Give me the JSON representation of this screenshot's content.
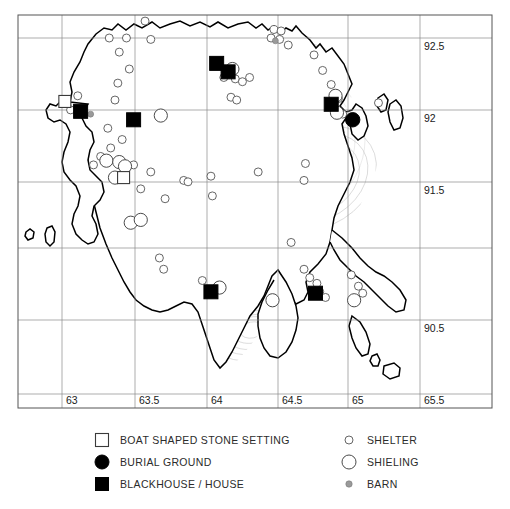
{
  "figure": {
    "kind": "archaeological-distribution-map",
    "background": "#ffffff"
  },
  "axes": {
    "x_ticks": [
      "63",
      "63.5",
      "64",
      "64.5",
      "65",
      "65.5"
    ],
    "y_ticks": [
      "92.5",
      "92",
      "91.5",
      "90.5"
    ],
    "grid": "on"
  },
  "legend": {
    "left_column": [
      {
        "label": "BOAT SHAPED STONE SETTING",
        "symbol": "open-square"
      },
      {
        "label": "BURIAL GROUND",
        "symbol": "filled-circle"
      },
      {
        "label": "BLACKHOUSE / HOUSE",
        "symbol": "filled-square"
      }
    ],
    "right_column": [
      {
        "label": "SHELTER",
        "symbol": "small-open-circle"
      },
      {
        "label": "SHIELING",
        "symbol": "large-open-circle"
      },
      {
        "label": "BARN",
        "symbol": "small-grey-dot"
      }
    ]
  },
  "chart_data": {
    "type": "scatter",
    "title": "",
    "xlabel": "",
    "ylabel": "",
    "xlim": [
      62.7,
      65.7
    ],
    "ylim": [
      90.2,
      92.8
    ],
    "grid": true,
    "legend_position": "below-plot",
    "series": [
      {
        "name": "BOAT SHAPED STONE SETTING",
        "symbol": "open-square",
        "color": "#ffffff",
        "points": [
          [
            63.02,
            92.05
          ],
          [
            63.43,
            91.51
          ]
        ]
      },
      {
        "name": "BURIAL GROUND",
        "symbol": "filled-circle",
        "color": "#000000",
        "points": [
          [
            65.03,
            91.92
          ]
        ]
      },
      {
        "name": "BLACKHOUSE / HOUSE",
        "symbol": "filled-square",
        "color": "#000000",
        "points": [
          [
            63.13,
            91.98
          ],
          [
            63.5,
            91.92
          ],
          [
            64.08,
            92.32
          ],
          [
            64.16,
            92.26
          ],
          [
            64.88,
            92.03
          ],
          [
            64.04,
            90.7
          ],
          [
            64.77,
            90.69
          ]
        ]
      },
      {
        "name": "SHELTER",
        "symbol": "small-open-circle",
        "color": "#ffffff",
        "points": [
          [
            63.58,
            92.62
          ],
          [
            63.33,
            92.5
          ],
          [
            63.45,
            92.5
          ],
          [
            63.62,
            92.49
          ],
          [
            63.4,
            92.4
          ],
          [
            63.47,
            92.28
          ],
          [
            64.48,
            92.56
          ],
          [
            64.53,
            92.55
          ],
          [
            64.46,
            92.5
          ],
          [
            64.52,
            92.49
          ],
          [
            64.58,
            92.45
          ],
          [
            64.76,
            92.38
          ],
          [
            64.82,
            92.27
          ],
          [
            64.88,
            92.17
          ],
          [
            64.93,
            92.07
          ],
          [
            64.96,
            91.96
          ],
          [
            65.21,
            92.04
          ],
          [
            63.39,
            92.18
          ],
          [
            63.37,
            92.06
          ],
          [
            63.11,
            92.09
          ],
          [
            63.06,
            91.99
          ],
          [
            63.32,
            91.86
          ],
          [
            63.42,
            91.78
          ],
          [
            63.34,
            91.72
          ],
          [
            63.27,
            91.66
          ],
          [
            63.22,
            91.6
          ],
          [
            63.5,
            91.6
          ],
          [
            63.62,
            91.55
          ],
          [
            63.55,
            91.43
          ],
          [
            63.72,
            91.36
          ],
          [
            63.85,
            91.49
          ],
          [
            63.88,
            91.48
          ],
          [
            64.04,
            91.52
          ],
          [
            64.05,
            91.38
          ],
          [
            64.13,
            92.22
          ],
          [
            64.21,
            92.21
          ],
          [
            64.26,
            92.19
          ],
          [
            64.31,
            92.22
          ],
          [
            64.18,
            92.08
          ],
          [
            64.22,
            92.06
          ],
          [
            64.37,
            91.55
          ],
          [
            64.7,
            91.61
          ],
          [
            64.69,
            91.49
          ],
          [
            63.98,
            90.78
          ],
          [
            64.6,
            91.05
          ],
          [
            64.69,
            90.86
          ],
          [
            64.73,
            90.8
          ],
          [
            64.78,
            90.76
          ],
          [
            64.8,
            90.7
          ],
          [
            64.84,
            90.66
          ],
          [
            65.02,
            90.82
          ],
          [
            65.07,
            90.74
          ],
          [
            65.1,
            90.69
          ],
          [
            63.68,
            90.94
          ],
          [
            63.71,
            90.86
          ],
          [
            63.52,
            91.2
          ],
          [
            63.47,
            91.18
          ]
        ]
      },
      {
        "name": "SHIELING",
        "symbol": "large-open-circle",
        "color": "#ffffff",
        "points": [
          [
            63.37,
            91.51
          ],
          [
            63.31,
            91.63
          ],
          [
            63.4,
            91.62
          ],
          [
            63.44,
            91.59
          ],
          [
            63.48,
            91.19
          ],
          [
            63.55,
            91.21
          ],
          [
            63.69,
            91.95
          ],
          [
            64.1,
            90.73
          ],
          [
            64.47,
            90.64
          ],
          [
            65.04,
            90.64
          ],
          [
            64.19,
            92.28
          ],
          [
            64.91,
            92.09
          ],
          [
            64.92,
            91.97
          ]
        ]
      },
      {
        "name": "BARN",
        "symbol": "small-grey-dot",
        "color": "#9a9a9a",
        "points": [
          [
            63.2,
            91.96
          ],
          [
            64.49,
            92.48
          ]
        ]
      }
    ]
  }
}
